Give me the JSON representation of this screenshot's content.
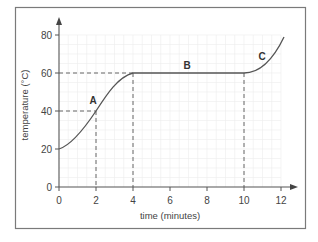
{
  "chart_data": {
    "type": "line",
    "title": "",
    "xlabel": "time (minutes)",
    "ylabel": "temperature (°C)",
    "xlim": [
      0,
      12
    ],
    "ylim": [
      0,
      80
    ],
    "x_ticks": [
      0,
      2,
      4,
      6,
      8,
      10,
      12
    ],
    "y_ticks": [
      0,
      20,
      40,
      60,
      80
    ],
    "grid": true,
    "series": [
      {
        "name": "heating curve",
        "x": [
          0,
          1,
          2,
          3,
          4,
          10,
          11,
          12,
          12.2
        ],
        "y": [
          20,
          28,
          40,
          52,
          60,
          60,
          64,
          74,
          79
        ]
      }
    ],
    "annotations": [
      {
        "label": "A",
        "x": 2,
        "y": 40,
        "note": "point on rising segment"
      },
      {
        "label": "B",
        "x": 7,
        "y": 60,
        "note": "flat plateau segment from 4 to 10 min"
      },
      {
        "label": "C",
        "x": 11.5,
        "y": 70,
        "note": "rising segment after 10 min"
      }
    ],
    "reference_lines": [
      {
        "type": "horizontal",
        "y": 40,
        "x_from": 0,
        "x_to": 2,
        "style": "dashed"
      },
      {
        "type": "vertical",
        "x": 2,
        "y_from": 0,
        "y_to": 40,
        "style": "dashed"
      },
      {
        "type": "horizontal",
        "y": 60,
        "x_from": 0,
        "x_to": 4,
        "style": "dashed"
      },
      {
        "type": "vertical",
        "x": 4,
        "y_from": 0,
        "y_to": 60,
        "style": "dashed"
      },
      {
        "type": "vertical",
        "x": 10,
        "y_from": 0,
        "y_to": 60,
        "style": "dashed"
      }
    ]
  },
  "labels": {
    "x_axis": "time (minutes)",
    "y_axis": "temperature (°C)",
    "x_ticks": [
      "0",
      "2",
      "4",
      "6",
      "8",
      "10",
      "12"
    ],
    "y_ticks": [
      "0",
      "20",
      "40",
      "60",
      "80"
    ],
    "point_a": "A",
    "point_b": "B",
    "point_c": "C"
  }
}
